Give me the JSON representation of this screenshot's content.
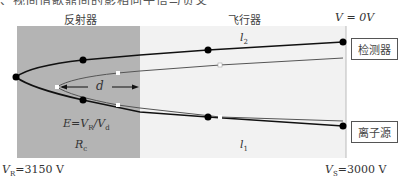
{
  "caption_fragment": "、视间借歌鼎间的影相向子倍与负叉",
  "regions": {
    "reflector": {
      "label": "反射器",
      "sublabel": "R",
      "sublabel_sub": "c",
      "formula": "E=V",
      "formula_sub1": "R",
      "formula_mid": "/V",
      "formula_sub2": "d",
      "color": "#b4b4b4"
    },
    "flight_tube": {
      "label": "飞行器",
      "color": "#f2f2f2"
    }
  },
  "potentials": {
    "top_right": "V = 0V",
    "bottom_left_var": "V",
    "bottom_left_sub": "R",
    "bottom_left_val": "=3150 V",
    "bottom_right_var": "V",
    "bottom_right_sub": "S",
    "bottom_right_val": "=3000 V"
  },
  "path_labels": {
    "upper": {
      "var": "l",
      "sub": "2"
    },
    "lower": {
      "var": "l",
      "sub": "1"
    },
    "distance": "d"
  },
  "components": {
    "detector": "检测器",
    "ion_source": "离子源"
  },
  "colors": {
    "path_outer": "#111111",
    "path_inner": "#555555",
    "dot": "#000000",
    "marker_open": "#ffffff"
  }
}
